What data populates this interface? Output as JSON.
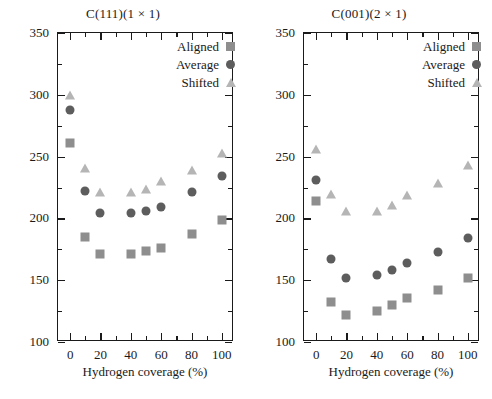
{
  "figure": {
    "xlabel": "Hydrogen coverage (%)",
    "ylabel": "Work of adhesion (mJ/m",
    "ylabel_sup": "2",
    "ylabel_close": ")",
    "colors": {
      "aligned": "#8e8e8e",
      "average": "#5d5d5d",
      "shifted": "#b5b5b5",
      "axis": "#1a1a1a",
      "background": "#ffffff"
    }
  },
  "legend": {
    "items": [
      {
        "label": "Aligned",
        "marker": "square-marker"
      },
      {
        "label": "Average",
        "marker": "circle-marker"
      },
      {
        "label": "Shifted",
        "marker": "triangle-marker"
      }
    ]
  },
  "axes": {
    "y_ticks": [
      "100",
      "150",
      "200",
      "250",
      "300",
      "350"
    ],
    "x_ticks": [
      "0",
      "20",
      "40",
      "60",
      "80",
      "100"
    ]
  },
  "chart_data": [
    {
      "type": "scatter",
      "title": "C(111)(1 × 1)",
      "xlabel": "Hydrogen coverage (%)",
      "ylabel": "Work of adhesion (mJ/m2)",
      "xlim": [
        -8,
        108
      ],
      "ylim": [
        100,
        350
      ],
      "x_ticks": [
        0,
        20,
        40,
        60,
        80,
        100
      ],
      "y_ticks": [
        100,
        150,
        200,
        250,
        300,
        350
      ],
      "x_minor_step": 10,
      "y_minor_step": 25,
      "grid": false,
      "legend_position": "top-right",
      "series": [
        {
          "name": "Aligned",
          "marker": "square",
          "color": "#8e8e8e",
          "x": [
            0,
            10,
            20,
            40,
            50,
            60,
            80,
            100
          ],
          "values": [
            261,
            185,
            171,
            171,
            174,
            176,
            187,
            199
          ]
        },
        {
          "name": "Average",
          "marker": "circle",
          "color": "#5d5d5d",
          "x": [
            0,
            10,
            20,
            40,
            50,
            60,
            80,
            100
          ],
          "values": [
            288,
            222,
            204,
            204,
            206,
            209,
            221,
            234
          ]
        },
        {
          "name": "Shifted",
          "marker": "triangle",
          "color": "#b5b5b5",
          "x": [
            0,
            10,
            20,
            40,
            50,
            60,
            80,
            100
          ],
          "values": [
            300,
            241,
            221,
            221,
            224,
            230,
            239,
            253
          ]
        }
      ]
    },
    {
      "type": "scatter",
      "title": "C(001)(2 × 1)",
      "xlabel": "Hydrogen coverage (%)",
      "ylabel": "Work of adhesion (mJ/m2)",
      "xlim": [
        -8,
        108
      ],
      "ylim": [
        100,
        350
      ],
      "x_ticks": [
        0,
        20,
        40,
        60,
        80,
        100
      ],
      "y_ticks": [
        100,
        150,
        200,
        250,
        300,
        350
      ],
      "x_minor_step": 10,
      "y_minor_step": 25,
      "grid": false,
      "legend_position": "top-right",
      "series": [
        {
          "name": "Aligned",
          "marker": "square",
          "color": "#8e8e8e",
          "x": [
            0,
            10,
            20,
            40,
            50,
            60,
            80,
            100
          ],
          "values": [
            214,
            132,
            122,
            125,
            130,
            136,
            142,
            152
          ]
        },
        {
          "name": "Average",
          "marker": "circle",
          "color": "#5d5d5d",
          "x": [
            0,
            10,
            20,
            40,
            50,
            60,
            80,
            100
          ],
          "values": [
            231,
            167,
            152,
            154,
            158,
            164,
            173,
            184
          ]
        },
        {
          "name": "Shifted",
          "marker": "triangle",
          "color": "#b5b5b5",
          "x": [
            0,
            10,
            20,
            40,
            50,
            60,
            80,
            100
          ],
          "values": [
            256,
            220,
            206,
            206,
            211,
            219,
            229,
            243
          ]
        }
      ]
    }
  ]
}
